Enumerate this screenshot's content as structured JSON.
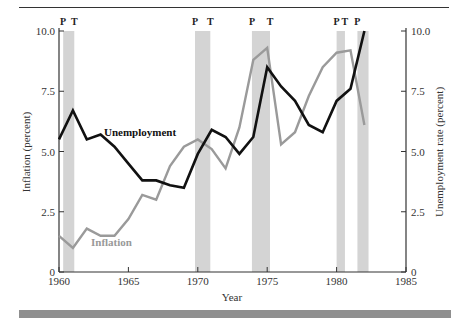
{
  "chart_data": {
    "type": "line",
    "title": "",
    "xlabel": "Year",
    "ylabel_left": "Inflation (percent)",
    "ylabel_right": "Unemployment rate (percent)",
    "xlim": [
      1960,
      1985
    ],
    "ylim_left": [
      0,
      10
    ],
    "ylim_right": [
      0,
      10
    ],
    "x_ticks": [
      "1960",
      "1965",
      "1970",
      "1975",
      "1980",
      "1985"
    ],
    "y_ticks_left": [
      "0",
      "2.5",
      "5.0",
      "7.5",
      "10.0"
    ],
    "y_ticks_right": [
      "0",
      "2.5",
      "5.0",
      "7.5",
      "10.0"
    ],
    "grid": false,
    "x": [
      1960,
      1961,
      1962,
      1963,
      1964,
      1965,
      1966,
      1967,
      1968,
      1969,
      1970,
      1971,
      1972,
      1973,
      1974,
      1975,
      1976,
      1977,
      1978,
      1979,
      1980,
      1981,
      1982
    ],
    "series": [
      {
        "name": "Unemployment",
        "color": "#111111",
        "values": [
          5.5,
          6.7,
          5.5,
          5.7,
          5.2,
          4.5,
          3.8,
          3.8,
          3.6,
          3.5,
          4.9,
          5.9,
          5.6,
          4.9,
          5.6,
          8.5,
          7.7,
          7.1,
          6.1,
          5.8,
          7.1,
          7.6,
          10.0
        ]
      },
      {
        "name": "Inflation",
        "color": "#9a9a9a",
        "values": [
          1.5,
          1.0,
          1.8,
          1.5,
          1.5,
          2.2,
          3.2,
          3.0,
          4.4,
          5.2,
          5.5,
          5.1,
          4.3,
          6.0,
          8.8,
          9.3,
          5.3,
          5.8,
          7.3,
          8.5,
          9.1,
          9.2,
          6.1
        ]
      }
    ],
    "shaded_periods": [
      {
        "start": 1960.3,
        "end": 1961.1,
        "labels": [
          "P",
          "T"
        ]
      },
      {
        "start": 1969.8,
        "end": 1970.9,
        "labels": [
          "P",
          "T"
        ]
      },
      {
        "start": 1973.9,
        "end": 1975.2,
        "labels": [
          "P",
          "T"
        ]
      },
      {
        "start": 1980.0,
        "end": 1980.6,
        "labels": [
          "P",
          "T"
        ]
      },
      {
        "start": 1981.5,
        "end": 1982.3,
        "labels": [
          "P"
        ]
      }
    ],
    "annotations": [
      {
        "text": "Unemployment",
        "x": 1962.2,
        "y": 5.6
      },
      {
        "text": "Inflation",
        "x": 1962.1,
        "y": 1.0
      }
    ],
    "legend": "inline labels"
  },
  "labels": {
    "xlabel": "Year",
    "ylabel_left": "Inflation (percent)",
    "ylabel_right": "Unemployment rate (percent)",
    "unemployment": "Unemployment",
    "inflation": "Inflation"
  },
  "colors": {
    "unemployment": "#111111",
    "inflation": "#9a9a9a",
    "shade": "#d4d4d4",
    "axis": "#333333",
    "footer": "#8f8f8f"
  }
}
